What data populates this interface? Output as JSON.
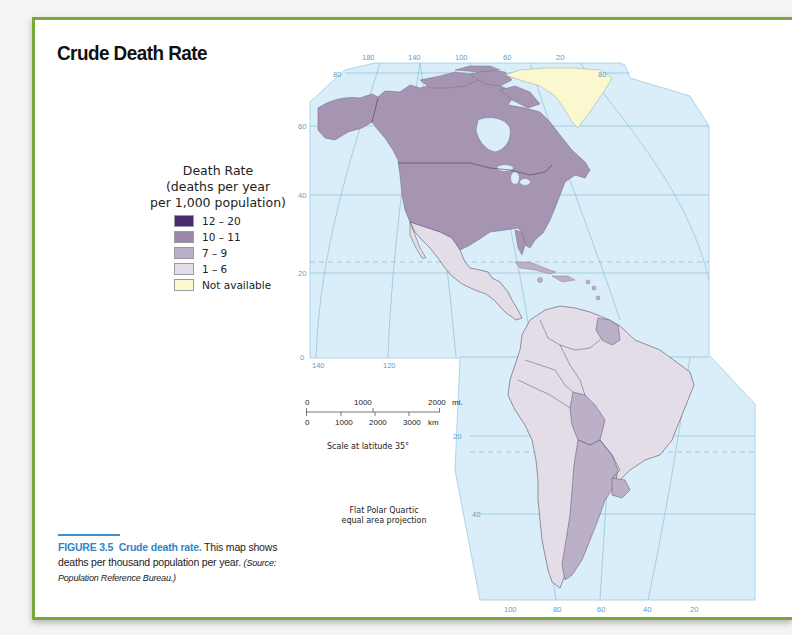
{
  "title": "Crude Death Rate",
  "legend": {
    "title_lines": [
      "Death Rate",
      "(deaths per year",
      "per 1,000 population)"
    ],
    "items": [
      {
        "label": "12 – 20",
        "color": "#4b2a6e"
      },
      {
        "label": "10 – 11",
        "color": "#9d87ab"
      },
      {
        "label": "7 – 9",
        "color": "#bcb0c9"
      },
      {
        "label": "1 – 6",
        "color": "#e2dde8"
      },
      {
        "label": "Not available",
        "color": "#fbf8cf"
      }
    ]
  },
  "scale": {
    "miles_labels": [
      "0",
      "1000",
      "2000"
    ],
    "miles_unit": "mi.",
    "km_labels": [
      "0",
      "1000",
      "2000",
      "3000"
    ],
    "km_unit": "km",
    "caption": "Scale at latitude 35°"
  },
  "projection": [
    "Flat Polar Quartic",
    "equal area projection"
  ],
  "figure": {
    "number": "FIGURE 3.5",
    "title": "Crude death rate.",
    "text": " This map shows deaths per thousand population per year. ",
    "source": "(Source: Population Reference Bureau.)"
  },
  "map": {
    "top_longitudes": [
      "180",
      "140",
      "100",
      "60",
      "20"
    ],
    "top_lat_left": "80",
    "top_lat_right": "80",
    "left_latitudes": [
      "60",
      "40",
      "20",
      "0"
    ],
    "mid_longitudes": [
      "140",
      "120"
    ],
    "south_latitudes": [
      "20",
      "40"
    ],
    "bottom_longitudes": [
      "100",
      "80",
      "60",
      "40",
      "20"
    ],
    "colors": {
      "ocean": "#d9eef8",
      "grid": "#7fb3d8",
      "rate_10_11": "#a595b3",
      "rate_7_9": "#bcb0c9",
      "rate_1_6": "#e3dde8",
      "not_available": "#fbf8cf",
      "frame_green": "#79a83a",
      "caption_blue": "#2f86c8"
    },
    "regions": [
      {
        "name": "Canada",
        "category": "10 – 11"
      },
      {
        "name": "United States",
        "category": "10 – 11"
      },
      {
        "name": "Greenland",
        "category": "Not available"
      },
      {
        "name": "Mexico",
        "category": "1 – 6"
      },
      {
        "name": "Central America",
        "category": "1 – 6"
      },
      {
        "name": "Caribbean",
        "category": "7 – 9"
      },
      {
        "name": "Guyana/Suriname",
        "category": "7 – 9"
      },
      {
        "name": "Bolivia",
        "category": "7 – 9"
      },
      {
        "name": "Argentina",
        "category": "7 – 9"
      },
      {
        "name": "Uruguay",
        "category": "7 – 9"
      },
      {
        "name": "Brazil",
        "category": "1 – 6"
      },
      {
        "name": "Chile",
        "category": "1 – 6"
      }
    ]
  }
}
